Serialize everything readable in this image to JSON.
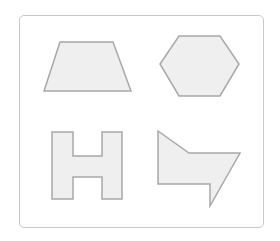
{
  "figure": {
    "colors": {
      "frame_border": "#c8c8c8",
      "shape_fill": "#efefef",
      "shape_stroke": "#a8a8a8",
      "background": "#ffffff"
    },
    "shapes": [
      {
        "name": "trapezoid",
        "points": "60,42 113,42 131,91 44,91"
      },
      {
        "name": "hexagon",
        "points": "179,36 220,36 239,64 220,96 179,96 160,64"
      },
      {
        "name": "h-shape",
        "points": "52,132 73,132 73,156 102,156 102,132 122,132 122,199 102,199 102,177 73,177 73,199 52,199"
      },
      {
        "name": "arrow-shape",
        "points": "158,131 189,153 240,153 210,206 210,184 158,184"
      }
    ]
  }
}
